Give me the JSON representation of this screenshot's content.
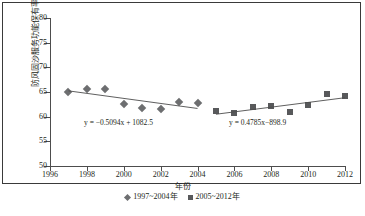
{
  "chart_data": {
    "type": "scatter",
    "title": "",
    "xlabel": "年份",
    "ylabel": "防风固沙服务功能保有率/%",
    "xlim": [
      1996,
      2012
    ],
    "ylim": [
      50,
      80
    ],
    "grid": false,
    "legend_position": "bottom",
    "xticks": [
      "1996",
      "1998",
      "2000",
      "2002",
      "2004",
      "2006",
      "2008",
      "2010",
      "2012"
    ],
    "xtick_values": [
      1996,
      1998,
      2000,
      2002,
      2004,
      2006,
      2008,
      2010,
      2012
    ],
    "yticks": [
      "50",
      "55",
      "60",
      "65",
      "70",
      "75",
      "80"
    ],
    "ytick_values": [
      50,
      55,
      60,
      65,
      70,
      75,
      80
    ],
    "series": [
      {
        "name": "1997~2004年",
        "marker": "diamond",
        "color": "#6d6e70",
        "x": [
          1997,
          1998,
          1999,
          2000,
          2001,
          2002,
          2003,
          2004
        ],
        "values": [
          65.1,
          65.6,
          65.7,
          62.5,
          61.7,
          61.6,
          63.0,
          62.8
        ],
        "trendline": {
          "equation": "y = −0.5094x + 1082.5",
          "slope": -0.5094,
          "intercept": 1082.5,
          "x_start": 1997,
          "x_end": 2004
        }
      },
      {
        "name": "2005~2012年",
        "marker": "square",
        "color": "#58595b",
        "x": [
          2005,
          2006,
          2007,
          2008,
          2009,
          2010,
          2011,
          2012
        ],
        "values": [
          61.1,
          60.7,
          61.9,
          62.1,
          61.0,
          62.4,
          64.6,
          64.1
        ],
        "trendline": {
          "equation": "y = 0.4785x−898.9",
          "slope": 0.4785,
          "intercept": -898.9,
          "x_start": 2005,
          "x_end": 2012
        }
      }
    ],
    "annotations": [
      {
        "text": "y = −0.5094x + 1082.5"
      },
      {
        "text": "y = 0.4785x−898.9"
      }
    ]
  },
  "legend": {
    "items": [
      {
        "label": "1997~2004年",
        "key": "diamond-marker-icon"
      },
      {
        "label": "2005~2012年",
        "key": "square-marker-icon"
      }
    ]
  },
  "axes": {
    "x_title": "年份",
    "y_title": "防风固沙服务功能保有率/%"
  }
}
